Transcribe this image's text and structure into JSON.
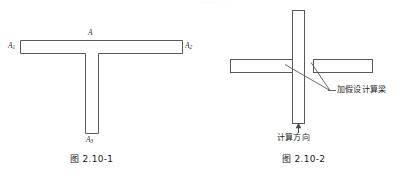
{
  "page": {
    "background_color": "#ffffff",
    "line_color": "#595959",
    "text_color": "#1a1a1a",
    "width": 404,
    "height": 177
  },
  "figures": [
    {
      "id": "fig-2-10-1",
      "caption": "图 2.10-1",
      "shape": "T-shaped member (tee section in plan)",
      "labels": {
        "top_center": {
          "base": "A",
          "sub": ""
        },
        "left_end": {
          "base": "A",
          "sub": "1"
        },
        "right_end": {
          "base": "A",
          "sub": "2"
        },
        "bottom_stem": {
          "base": "A",
          "sub": "3"
        }
      }
    },
    {
      "id": "fig-2-10-2",
      "caption": "图 2.10-2",
      "shape": "Cross-shaped member with vertical column and two horizontal beams",
      "annotations": {
        "beams": "加假设计算梁",
        "direction": "计算方向"
      }
    }
  ],
  "scan_artifact": {
    "text": ". .  .   . .   . .  . ."
  }
}
